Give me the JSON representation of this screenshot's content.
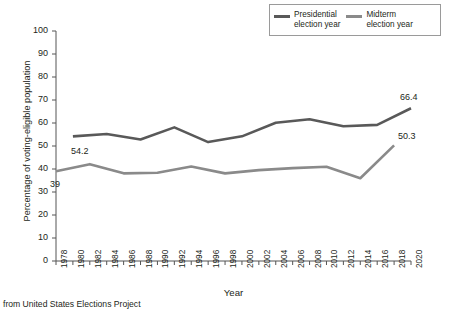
{
  "chart_data": {
    "type": "line",
    "title": "",
    "xlabel": "Year",
    "ylabel": "Percentage of voting-eligible population",
    "caption": "from United States Elections Project",
    "xlim": [
      1978,
      2020
    ],
    "ylim": [
      0,
      100
    ],
    "ytick_step": 10,
    "xtick_step": 2,
    "grid": false,
    "legend_position": "top-right",
    "yticks": [
      "100",
      "90",
      "80",
      "70",
      "60",
      "50",
      "40",
      "30",
      "20",
      "10",
      "0"
    ],
    "xticks": [
      "1978",
      "1980",
      "1982",
      "1984",
      "1986",
      "1988",
      "1990",
      "1992",
      "1994",
      "1996",
      "1998",
      "2000",
      "2002",
      "2004",
      "2006",
      "2008",
      "2010",
      "2012",
      "2014",
      "2016",
      "2018",
      "2020"
    ],
    "series": [
      {
        "name": "Presidential\nelection year",
        "legend_label": "Presidential\nelection year",
        "color": "#595959",
        "x": [
          1980,
          1984,
          1988,
          1992,
          1996,
          2000,
          2004,
          2008,
          2012,
          2016,
          2020
        ],
        "values": [
          54.2,
          55.2,
          52.8,
          58.1,
          51.7,
          54.2,
          60.1,
          61.6,
          58.6,
          59.2,
          66.4
        ]
      },
      {
        "name": "Midterm\nelection year",
        "legend_label": "Midterm\nelection year",
        "color": "#8a8a8a",
        "x": [
          1978,
          1982,
          1986,
          1990,
          1994,
          1998,
          2002,
          2006,
          2010,
          2014,
          2018
        ],
        "values": [
          39.0,
          42.1,
          38.1,
          38.4,
          41.1,
          38.1,
          39.5,
          40.4,
          41.0,
          36.0,
          50.3
        ]
      }
    ],
    "annotations": [
      {
        "text": "54.2",
        "x": 1980,
        "y": 54.2
      },
      {
        "text": "39",
        "x": 1978,
        "y": 39.0
      },
      {
        "text": "66.4",
        "x": 2020,
        "y": 66.4
      },
      {
        "text": "50.3",
        "x": 2018,
        "y": 50.3
      }
    ]
  },
  "legend": {
    "entries": [
      {
        "label": "Presidential\nelection year",
        "color": "#595959"
      },
      {
        "label": "Midterm\nelection year",
        "color": "#8a8a8a"
      }
    ]
  },
  "axes": {
    "x_title": "Year",
    "y_title": "Percentage of voting-eligible population"
  },
  "source_note": "from United States Elections Project"
}
